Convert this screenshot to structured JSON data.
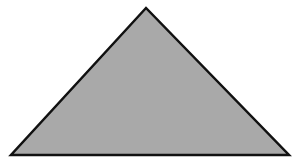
{
  "diagram": {
    "shape": "triangle",
    "type": "isosceles",
    "vertices": [
      {
        "name": "apex",
        "x": 146,
        "y": 8
      },
      {
        "name": "bottom-left",
        "x": 11,
        "y": 155
      },
      {
        "name": "bottom-right",
        "x": 289,
        "y": 155
      }
    ],
    "fill_color": "#a9a9a9",
    "stroke_color": "#111111",
    "stroke_width": 2.5,
    "background_color": "#ffffff"
  }
}
